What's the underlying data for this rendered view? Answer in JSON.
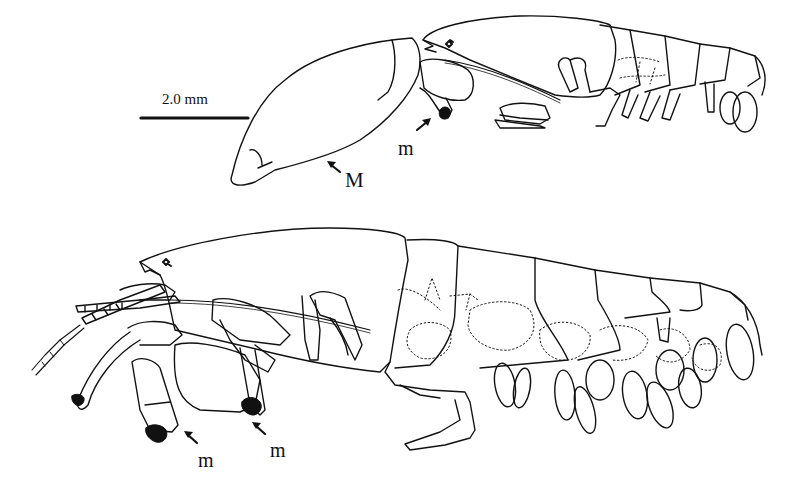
{
  "figure": {
    "scale_bar": {
      "label": "2.0 mm"
    },
    "labels": {
      "major_chela": "M",
      "minor_top": "m",
      "minor_bottom_left": "m",
      "minor_bottom_right": "m"
    },
    "specimens": [
      {
        "id": "top",
        "description": "lateral view, male with enlarged major gnathopod (M) and minor gnathopod brush (m)"
      },
      {
        "id": "bottom",
        "description": "lateral view, full body with antennae and two minor gnathopod brushes (m)"
      }
    ],
    "colors": {
      "line": "#111111",
      "background": "#ffffff"
    }
  }
}
